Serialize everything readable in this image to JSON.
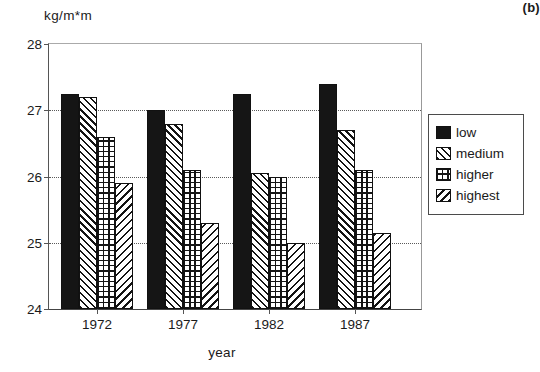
{
  "chart_data": {
    "type": "bar",
    "title": "",
    "panel_label": "(b)",
    "xlabel": "year",
    "ylabel": "kg/m*m",
    "categories": [
      "1972",
      "1977",
      "1982",
      "1987"
    ],
    "ylim": [
      24,
      28
    ],
    "yticks": [
      24,
      25,
      26,
      27,
      28
    ],
    "grid": "horizontal dotted gridlines at 25, 26, 27",
    "legend_position": "right, outside plot",
    "series": [
      {
        "name": "low",
        "pattern": "solid-black",
        "values": [
          27.25,
          27.0,
          27.25,
          27.4
        ]
      },
      {
        "name": "medium",
        "pattern": "diagonal-hatch-fwd",
        "values": [
          27.2,
          26.8,
          26.05,
          26.7
        ]
      },
      {
        "name": "higher",
        "pattern": "crosshatch-grid",
        "values": [
          26.6,
          26.1,
          26.0,
          26.1
        ]
      },
      {
        "name": "highest",
        "pattern": "diagonal-hatch-back",
        "values": [
          25.9,
          25.3,
          25.0,
          25.15
        ]
      }
    ]
  },
  "legend": {
    "items": [
      {
        "label": "low"
      },
      {
        "label": "medium"
      },
      {
        "label": "higher"
      },
      {
        "label": "highest"
      }
    ]
  }
}
